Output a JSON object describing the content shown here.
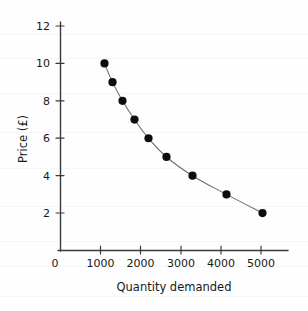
{
  "chart_data": {
    "type": "line",
    "title": "",
    "subtitle": "",
    "xlabel": "Quantity demanded",
    "ylabel": "Price (£)",
    "xlim": [
      0,
      5400
    ],
    "ylim": [
      0,
      12.8
    ],
    "xticks": [
      0,
      1000,
      2000,
      3000,
      4000,
      5000
    ],
    "xticklabels": [
      "0",
      "1000",
      "2000",
      "3000",
      "4000",
      "5000"
    ],
    "yticks": [
      2,
      4,
      6,
      8,
      10,
      12
    ],
    "yticklabels": [
      "2",
      "4",
      "6",
      "8",
      "10",
      "12"
    ],
    "grid": false,
    "legend": "none",
    "marker": "filled-circle",
    "marker_color": "#0d0d0d",
    "line_color": "#6e6e72",
    "x": [
      1100,
      1300,
      1550,
      1850,
      2200,
      2650,
      3300,
      4150,
      5050
    ],
    "y": [
      10,
      9,
      8,
      7,
      6,
      5,
      4,
      3,
      2
    ],
    "series": [
      {
        "name": "Demand curve",
        "points": [
          {
            "quantity": 1100,
            "price": 10
          },
          {
            "quantity": 1300,
            "price": 9
          },
          {
            "quantity": 1550,
            "price": 8
          },
          {
            "quantity": 1850,
            "price": 7
          },
          {
            "quantity": 2200,
            "price": 6
          },
          {
            "quantity": 2650,
            "price": 5
          },
          {
            "quantity": 3300,
            "price": 4
          },
          {
            "quantity": 4150,
            "price": 3
          },
          {
            "quantity": 5050,
            "price": 2
          }
        ]
      }
    ]
  }
}
